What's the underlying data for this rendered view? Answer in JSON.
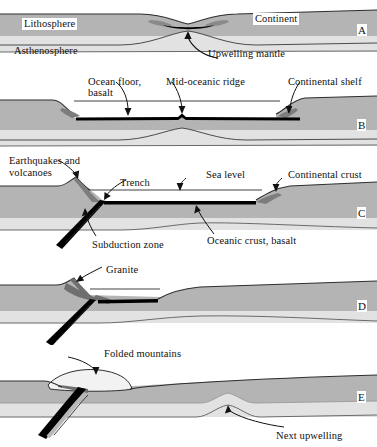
{
  "figure": {
    "type": "geologic-cross-section-sequence",
    "width": 377,
    "height": 447,
    "background": "#ffffff"
  },
  "colors": {
    "lithosphere_fill": "#b4b4b4",
    "lower_lithosphere_fill": "#e2e2e2",
    "asthenosphere_fill": "#ffffff",
    "crust_wedge_dark": "#7d7d7d",
    "oceanic_crust": "#000000",
    "outline": "#3a3a3a",
    "thin_line": "#6a6a6a",
    "text": "#111111",
    "label_box": "#ffffff"
  },
  "panels": [
    {
      "letter": "A",
      "name": "continental-rifting",
      "labels": [
        {
          "id": "lithosphere",
          "text": "Lithosphere",
          "boxed": true,
          "x": 22,
          "y": 18
        },
        {
          "id": "continent",
          "text": "Continent",
          "boxed": true,
          "x": 253,
          "y": 13
        },
        {
          "id": "asthenosphere",
          "text": "Asthenosphere",
          "boxed": false,
          "x": 14,
          "y": 45
        },
        {
          "id": "upwelling-mantle",
          "text": "Upwelling mantle",
          "boxed": false,
          "x": 208,
          "y": 48
        }
      ]
    },
    {
      "letter": "B",
      "name": "ocean-basin-with-mid-ocean-ridge",
      "labels": [
        {
          "id": "ocean-floor-basalt",
          "text": "Ocean floor,",
          "boxed": false,
          "x": 88,
          "y": 76
        },
        {
          "id": "ocean-floor-basalt-2",
          "text": "basalt",
          "boxed": false,
          "x": 88,
          "y": 87
        },
        {
          "id": "mid-oceanic-ridge",
          "text": "Mid-oceanic ridge",
          "boxed": false,
          "x": 166,
          "y": 76
        },
        {
          "id": "continental-shelf",
          "text": "Continental shelf",
          "boxed": false,
          "x": 288,
          "y": 76
        }
      ]
    },
    {
      "letter": "C",
      "name": "subduction-and-island-arc",
      "labels": [
        {
          "id": "earthquakes-volcanoes",
          "text": "Earthquakes and",
          "boxed": false,
          "x": 9,
          "y": 155
        },
        {
          "id": "earthquakes-volcanoes-2",
          "text": "volcanoes",
          "boxed": false,
          "x": 9,
          "y": 167
        },
        {
          "id": "trench",
          "text": "Trench",
          "boxed": false,
          "x": 120,
          "y": 177
        },
        {
          "id": "sea-level",
          "text": "Sea level",
          "boxed": false,
          "x": 206,
          "y": 169
        },
        {
          "id": "continental-crust",
          "text": "Continental crust",
          "boxed": false,
          "x": 288,
          "y": 169
        },
        {
          "id": "subduction-zone",
          "text": "Subduction zone",
          "boxed": false,
          "x": 92,
          "y": 239
        },
        {
          "id": "oceanic-crust-basalt",
          "text": "Oceanic crust, basalt",
          "boxed": false,
          "x": 207,
          "y": 235
        }
      ]
    },
    {
      "letter": "D",
      "name": "granite-pluton-emplacement",
      "labels": [
        {
          "id": "granite",
          "text": "Granite",
          "boxed": false,
          "x": 106,
          "y": 264
        }
      ]
    },
    {
      "letter": "E",
      "name": "continental-collision-folded-mountains",
      "labels": [
        {
          "id": "folded-mountains",
          "text": "Folded mountains",
          "boxed": false,
          "x": 104,
          "y": 348
        },
        {
          "id": "next-upwelling",
          "text": "Next upwelling",
          "boxed": false,
          "x": 276,
          "y": 430
        }
      ]
    }
  ]
}
